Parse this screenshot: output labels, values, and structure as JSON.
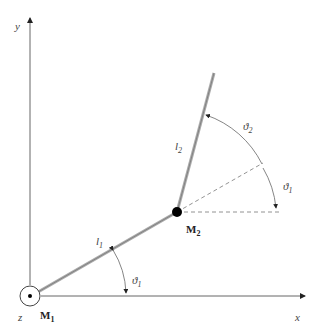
{
  "labels": {
    "y_axis": "y",
    "x_axis": "x",
    "z_axis": "z",
    "m1": "M",
    "m1_sub": "1",
    "m2": "M",
    "m2_sub": "2",
    "l1": "l",
    "l1_sub": "1",
    "l2": "l",
    "l2_sub": "2",
    "theta1_base": "ϑ",
    "theta1_base_sub": "1",
    "theta1_upper": "ϑ",
    "theta1_upper_sub": "1",
    "theta2": "ϑ",
    "theta2_sub": "2"
  },
  "colors": {
    "axis": "#555555",
    "link": "#999999",
    "dashed": "#777777",
    "joint": "#000000"
  }
}
